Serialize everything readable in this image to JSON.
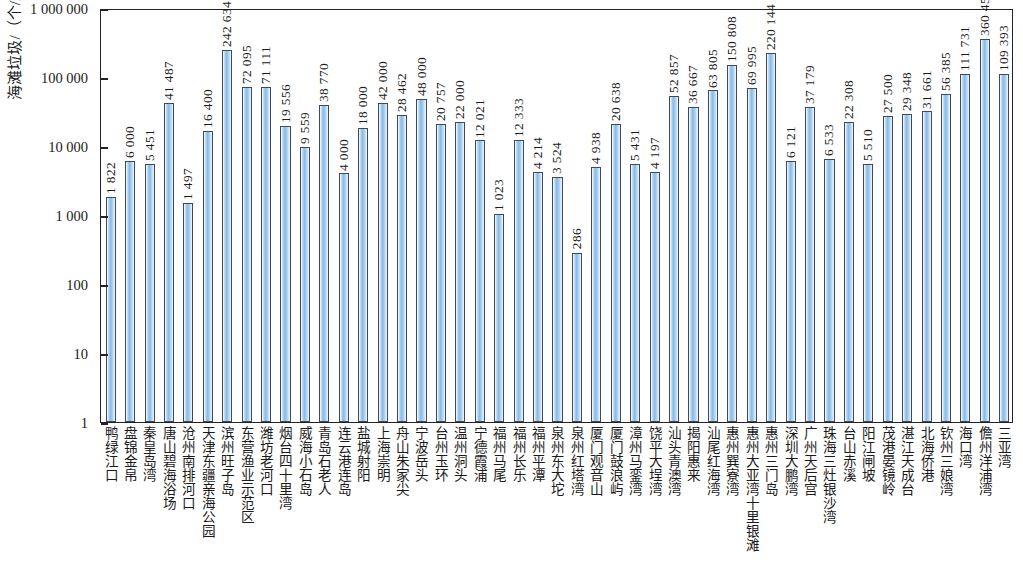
{
  "chart_data": {
    "type": "bar",
    "title": "",
    "xlabel": "",
    "ylabel": "海滩垃圾/（个/km²）",
    "yscale": "log",
    "ylim": [
      1,
      1000000
    ],
    "grid": false,
    "legend": null,
    "y_ticks": [
      1,
      10,
      100,
      1000,
      10000,
      100000,
      1000000
    ],
    "y_tick_labels": [
      "1",
      "10",
      "100",
      "1 000",
      "10 000",
      "100 000",
      "1 000 000"
    ],
    "bar_color": "#8fc0e8",
    "bar_edge_color": "#404a55",
    "categories": [
      "鸭绿江口",
      "盘锦金帛",
      "秦皇岛湾",
      "唐山碧海浴场",
      "沧州南排河口",
      "天津东疆亲海公园",
      "滨州旺子岛",
      "东营渔业示范区",
      "潍坊老河口",
      "烟台四十里湾",
      "威海小石岛",
      "青岛石老人",
      "连云港连岛",
      "盐城射阳",
      "上海崇明",
      "舟山朱家尖",
      "宁波岳头",
      "台州玉环",
      "温州洞头",
      "宁德霞浦",
      "福州马尾",
      "福州长乐",
      "福州平潭",
      "泉州东大坨",
      "泉州红塔湾",
      "厦门观音山",
      "厦门鼓浪屿",
      "漳州马銮湾",
      "饶平大埕湾",
      "汕头青澳湾",
      "揭阳惠来",
      "汕尾红海湾",
      "惠州巽寮湾",
      "惠州大亚湾十里银滩",
      "惠州三门岛",
      "深圳大鹏湾",
      "广州天后宫",
      "珠海三灶银沙湾",
      "台山赤溪",
      "阳江闸坡",
      "茂港晏镜岭",
      "湛江天成台",
      "北海侨港",
      "钦州三娘湾",
      "海口湾",
      "儋州洋浦湾",
      "三亚湾"
    ],
    "values": [
      1822,
      6000,
      5451,
      41487,
      1497,
      16400,
      242634,
      72095,
      71111,
      19556,
      9559,
      38770,
      4000,
      18000,
      42000,
      28462,
      48000,
      20757,
      22000,
      12021,
      1023,
      12333,
      4214,
      3524,
      286,
      4938,
      20638,
      5431,
      4197,
      52857,
      36667,
      63805,
      150808,
      69995,
      220144,
      6121,
      37179,
      6533,
      22308,
      5510,
      27500,
      29348,
      31661,
      56385,
      111731,
      360453,
      109393
    ],
    "value_labels": [
      "1 822",
      "6 000",
      "5 451",
      "41 487",
      "1 497",
      "16 400",
      "242 634",
      "72 095",
      "71 111",
      "19 556",
      "9 559",
      "38 770",
      "4 000",
      "18 000",
      "42 000",
      "28 462",
      "48 000",
      "20 757",
      "22 000",
      "12 021",
      "1 023",
      "12 333",
      "4 214",
      "3 524",
      "286",
      "4 938",
      "20 638",
      "5 431",
      "4 197",
      "52 857",
      "36 667",
      "63 805",
      "150 808",
      "69 995",
      "220 144",
      "6 121",
      "37 179",
      "6 533",
      "22 308",
      "5 510",
      "27 500",
      "29 348",
      "31 661",
      "56 385",
      "111 731",
      "360 453",
      "109 393"
    ]
  }
}
